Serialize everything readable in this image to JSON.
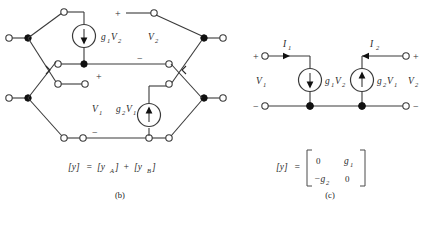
{
  "figure": {
    "panels": [
      {
        "id": "panel-b",
        "caption": "(b)",
        "labels": {
          "source1": "g",
          "source1_sub": "1",
          "source1_var": "V",
          "source1_var_sub": "2",
          "source2": "g",
          "source2_sub": "2",
          "source2_var": "V",
          "source2_var_sub": "1",
          "v_top": "V",
          "v_top_sub": "2",
          "v_bottom": "V",
          "v_bottom_sub": "1",
          "plus_top": "+",
          "minus_top": "−",
          "plus_bottom": "+",
          "minus_bottom": "−"
        },
        "equation": {
          "lhs": "[y]",
          "eq": "=",
          "term_a": "[y",
          "term_a_sub": "A",
          "term_a_close": "]",
          "plus": "+",
          "term_b": "[y",
          "term_b_sub": "B",
          "term_b_close": "]"
        },
        "icons": {
          "source1_arrow": "arrow-down-icon",
          "source2_arrow": "arrow-up-icon"
        }
      },
      {
        "id": "panel-c",
        "caption": "(c)",
        "labels": {
          "current1": "I",
          "current1_sub": "1",
          "current2": "I",
          "current2_sub": "2",
          "v_left": "V",
          "v_left_sub": "1",
          "v_right": "V",
          "v_right_sub": "2",
          "source1": "g",
          "source1_sub": "1",
          "source1_var": "V",
          "source1_var_sub": "2",
          "source2": "g",
          "source2_sub": "2",
          "source2_var": "V",
          "source2_var_sub": "1",
          "plus_left": "+",
          "minus_left": "−",
          "plus_right": "+",
          "minus_right": "−"
        },
        "equation": {
          "lhs": "[y]",
          "eq": "=",
          "matrix": [
            [
              "0",
              "g"
            ],
            [
              "−g",
              "0"
            ]
          ],
          "matrix_subs": [
            [
              "",
              "1"
            ],
            [
              "2",
              ""
            ]
          ]
        },
        "icons": {
          "source1_arrow": "arrow-down-icon",
          "source2_arrow": "arrow-up-icon",
          "current1_arrow": "arrow-right-icon",
          "current2_arrow": "arrow-left-icon"
        }
      }
    ],
    "colors": {
      "wire": "#3a3a3a",
      "node": "#111111",
      "text": "#2b2b2b",
      "background": "#ffffff"
    }
  }
}
